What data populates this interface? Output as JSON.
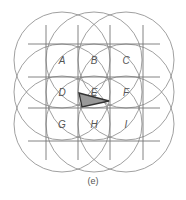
{
  "figure": {
    "caption": "(e)",
    "colors": {
      "line": "#777777",
      "circle": "#888888",
      "triangle_fill": "#999999",
      "triangle_stroke": "#333333",
      "label": "#555555"
    },
    "grid": {
      "vertical_x": [
        46,
        78,
        110,
        143
      ],
      "horizontal_y": [
        44,
        77,
        108,
        141
      ],
      "x_span": [
        28,
        160
      ],
      "y_span": [
        25,
        160
      ]
    },
    "cells": [
      {
        "label": "A",
        "cx": 62,
        "cy": 60
      },
      {
        "label": "B",
        "cx": 94,
        "cy": 60
      },
      {
        "label": "C",
        "cx": 126,
        "cy": 60
      },
      {
        "label": "D",
        "cx": 62,
        "cy": 92
      },
      {
        "label": "E",
        "cx": 94,
        "cy": 92
      },
      {
        "label": "F",
        "cx": 126,
        "cy": 92
      },
      {
        "label": "G",
        "cx": 62,
        "cy": 124
      },
      {
        "label": "H",
        "cx": 94,
        "cy": 124
      },
      {
        "label": "I",
        "cx": 126,
        "cy": 124
      }
    ],
    "circle_radius": 48,
    "triangle": [
      [
        79,
        93
      ],
      [
        109,
        101
      ],
      [
        82,
        107
      ]
    ]
  }
}
